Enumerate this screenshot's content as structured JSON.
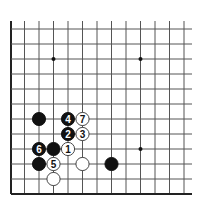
{
  "diagram": {
    "type": "go-board-fragment",
    "colors": {
      "background": "#ffffff",
      "line": "#555555",
      "border": "#222222",
      "black_stone": "#111111",
      "white_stone": "#ffffff",
      "white_stroke": "#333333"
    },
    "grid": {
      "columns_x": [
        11,
        24.5,
        39,
        53.5,
        68,
        82.5,
        97,
        111.5,
        126,
        140.5,
        155,
        169.5,
        184
      ],
      "rows_y": [
        29,
        44,
        59,
        74,
        89,
        104,
        119,
        134,
        149,
        164,
        179,
        194
      ],
      "left_border_col": 0,
      "bottom_border_row": 11,
      "line_top_y": 21,
      "line_right_x": 192
    },
    "star_points": [
      {
        "col": 3,
        "row": 2
      },
      {
        "col": 9,
        "row": 2
      },
      {
        "col": 9,
        "row": 8
      }
    ],
    "stones": [
      {
        "color": "black",
        "col": 2,
        "row": 6,
        "label": ""
      },
      {
        "color": "black",
        "col": 4,
        "row": 6,
        "label": "4"
      },
      {
        "color": "white",
        "col": 5,
        "row": 6,
        "label": "7"
      },
      {
        "color": "black",
        "col": 4,
        "row": 7,
        "label": "2"
      },
      {
        "color": "white",
        "col": 5,
        "row": 7,
        "label": "3"
      },
      {
        "color": "black",
        "col": 2,
        "row": 8,
        "label": "6"
      },
      {
        "color": "black",
        "col": 3,
        "row": 8,
        "label": ""
      },
      {
        "color": "white",
        "col": 4,
        "row": 8,
        "label": "1"
      },
      {
        "color": "black",
        "col": 2,
        "row": 9,
        "label": ""
      },
      {
        "color": "white",
        "col": 3,
        "row": 9,
        "label": "5"
      },
      {
        "color": "white",
        "col": 5,
        "row": 9,
        "label": ""
      },
      {
        "color": "black",
        "col": 7,
        "row": 9,
        "label": ""
      },
      {
        "color": "white",
        "col": 3,
        "row": 10,
        "label": ""
      }
    ]
  }
}
